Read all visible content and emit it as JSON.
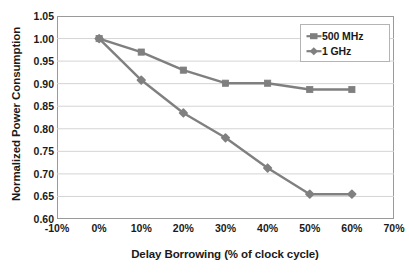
{
  "chart_data": {
    "type": "line",
    "title": "",
    "xlabel": "Delay Borrowing (% of clock cycle)",
    "ylabel": "Normalized Power Consumption",
    "xlim": [
      -10,
      70
    ],
    "ylim": [
      0.6,
      1.05
    ],
    "xticks": [
      "-10%",
      "0%",
      "10%",
      "20%",
      "30%",
      "40%",
      "50%",
      "60%",
      "70%"
    ],
    "xtick_values": [
      -10,
      0,
      10,
      20,
      30,
      40,
      50,
      60,
      70
    ],
    "yticks": [
      "0.60",
      "0.65",
      "0.70",
      "0.75",
      "0.80",
      "0.85",
      "0.90",
      "0.95",
      "1.00",
      "1.05"
    ],
    "ytick_values": [
      0.6,
      0.65,
      0.7,
      0.75,
      0.8,
      0.85,
      0.9,
      0.95,
      1.0,
      1.05
    ],
    "grid": "horizontal",
    "legend_position": "top-right",
    "x": [
      0,
      10,
      20,
      30,
      40,
      50,
      60
    ],
    "series": [
      {
        "name": "500 MHz",
        "marker": "square",
        "color": "#7f7f7f",
        "values": [
          1.0,
          0.97,
          0.93,
          0.901,
          0.901,
          0.887,
          0.887
        ]
      },
      {
        "name": "1 GHz",
        "marker": "diamond",
        "color": "#808080",
        "values": [
          1.0,
          0.908,
          0.835,
          0.78,
          0.713,
          0.655,
          0.655
        ]
      }
    ]
  },
  "legend": {
    "entries": [
      {
        "label": "500 MHz"
      },
      {
        "label": "1 GHz"
      }
    ]
  },
  "colors": {
    "series_500mhz": "#7f7f7f",
    "series_1ghz": "#808080",
    "gridline": "#d4d4d4",
    "axis": "#9a9a9a",
    "text": "#1a1a1a",
    "background": "#ffffff"
  }
}
